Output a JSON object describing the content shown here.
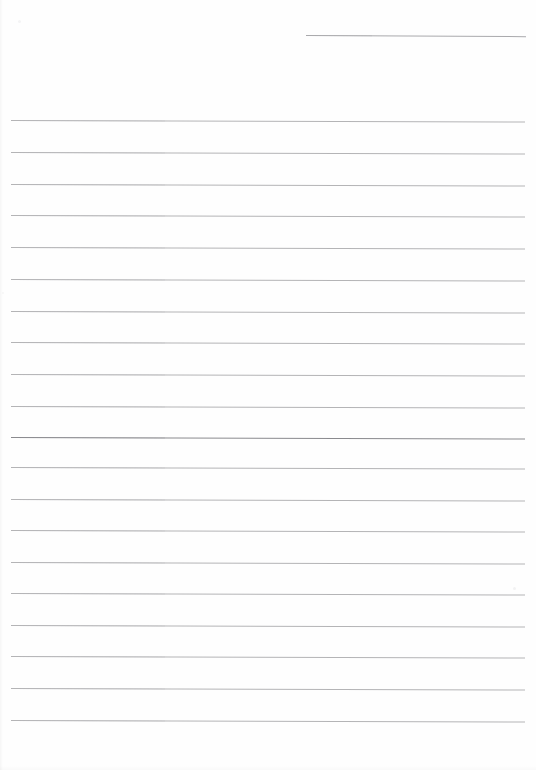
{
  "document": {
    "type": "scanned-blank-lined-page",
    "page_width": 536,
    "page_height": 770,
    "background_color": "#ffffff",
    "visible_text": "",
    "rule_color": "#b4b4b6",
    "rule_color_emphasis": "#8a8a8e"
  },
  "header_rule": {
    "name": "top-right-rule",
    "x": 306,
    "y": 35,
    "width": 220,
    "color": "#a9a9ac",
    "thickness": 1
  },
  "rules": [
    {
      "index": 1,
      "y": 120,
      "x": 11,
      "width": 514,
      "emphasis": false,
      "slope": 1.5
    },
    {
      "index": 2,
      "y": 152,
      "x": 11,
      "width": 514,
      "emphasis": false,
      "slope": 1.5
    },
    {
      "index": 3,
      "y": 184,
      "x": 11,
      "width": 514,
      "emphasis": false,
      "slope": 1.5
    },
    {
      "index": 4,
      "y": 215,
      "x": 11,
      "width": 514,
      "emphasis": false,
      "slope": 1.5
    },
    {
      "index": 5,
      "y": 247,
      "x": 11,
      "width": 514,
      "emphasis": false,
      "slope": 1.5
    },
    {
      "index": 6,
      "y": 279,
      "x": 11,
      "width": 514,
      "emphasis": false,
      "slope": 1.5
    },
    {
      "index": 7,
      "y": 311,
      "x": 11,
      "width": 514,
      "emphasis": false,
      "slope": 1.5
    },
    {
      "index": 8,
      "y": 342,
      "x": 11,
      "width": 514,
      "emphasis": false,
      "slope": 1.5
    },
    {
      "index": 9,
      "y": 374,
      "x": 11,
      "width": 514,
      "emphasis": false,
      "slope": 1.5
    },
    {
      "index": 10,
      "y": 406,
      "x": 11,
      "width": 514,
      "emphasis": false,
      "slope": 1.5
    },
    {
      "index": 11,
      "y": 437,
      "x": 11,
      "width": 514,
      "emphasis": true,
      "slope": 1.5
    },
    {
      "index": 12,
      "y": 467,
      "x": 11,
      "width": 514,
      "emphasis": false,
      "slope": 1.5
    },
    {
      "index": 13,
      "y": 499,
      "x": 11,
      "width": 514,
      "emphasis": false,
      "slope": 1.5
    },
    {
      "index": 14,
      "y": 530,
      "x": 11,
      "width": 514,
      "emphasis": false,
      "slope": 1.5
    },
    {
      "index": 15,
      "y": 562,
      "x": 11,
      "width": 514,
      "emphasis": false,
      "slope": 1.5
    },
    {
      "index": 16,
      "y": 593,
      "x": 11,
      "width": 514,
      "emphasis": false,
      "slope": 1.5
    },
    {
      "index": 17,
      "y": 625,
      "x": 11,
      "width": 514,
      "emphasis": false,
      "slope": 1.5
    },
    {
      "index": 18,
      "y": 656,
      "x": 11,
      "width": 514,
      "emphasis": false,
      "slope": 1.5
    },
    {
      "index": 19,
      "y": 688,
      "x": 11,
      "width": 514,
      "emphasis": false,
      "slope": 1.5
    },
    {
      "index": 20,
      "y": 720,
      "x": 11,
      "width": 514,
      "emphasis": false,
      "slope": 1.5
    }
  ],
  "specks": [
    {
      "x": 18,
      "y": 20,
      "size": 3,
      "opacity": 0.35
    },
    {
      "x": 513,
      "y": 587,
      "size": 3,
      "opacity": 0.4
    },
    {
      "x": 2,
      "y": 292,
      "size": 2,
      "opacity": 0.25
    }
  ]
}
